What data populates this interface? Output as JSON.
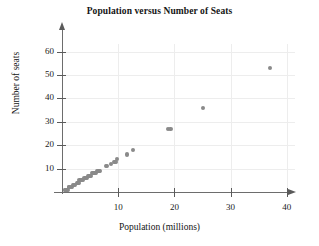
{
  "chart_data": {
    "type": "scatter",
    "title": "Population versus Number of Seats",
    "xlabel": "Population (millions)",
    "ylabel": "Number of seats",
    "xlim": [
      0,
      42
    ],
    "ylim": [
      0,
      65
    ],
    "xticks": [
      10,
      20,
      30,
      40
    ],
    "yticks": [
      10,
      20,
      30,
      40,
      50,
      60
    ],
    "grid": true,
    "legend": null,
    "marker_color": "#8a8a8a",
    "axis_color": "#5a5a5a",
    "grid_color": "#ededed",
    "series": [
      {
        "name": "States",
        "points": [
          [
            0.6,
            1
          ],
          [
            0.6,
            1
          ],
          [
            0.7,
            1
          ],
          [
            0.8,
            1
          ],
          [
            0.9,
            1
          ],
          [
            1.1,
            1
          ],
          [
            1.3,
            2
          ],
          [
            1.3,
            2
          ],
          [
            1.6,
            2
          ],
          [
            1.8,
            2
          ],
          [
            2.0,
            3
          ],
          [
            2.1,
            3
          ],
          [
            2.3,
            3
          ],
          [
            2.6,
            4
          ],
          [
            2.8,
            4
          ],
          [
            2.9,
            4
          ],
          [
            3.0,
            4
          ],
          [
            3.1,
            5
          ],
          [
            3.4,
            5
          ],
          [
            3.6,
            5
          ],
          [
            3.8,
            5
          ],
          [
            4.0,
            6
          ],
          [
            4.3,
            6
          ],
          [
            4.5,
            6
          ],
          [
            4.7,
            7
          ],
          [
            4.9,
            7
          ],
          [
            5.1,
            7
          ],
          [
            5.3,
            8
          ],
          [
            5.6,
            8
          ],
          [
            5.8,
            8
          ],
          [
            6.0,
            8
          ],
          [
            6.3,
            9
          ],
          [
            6.5,
            9
          ],
          [
            6.6,
            9
          ],
          [
            6.7,
            9
          ],
          [
            7.8,
            11
          ],
          [
            8.0,
            11
          ],
          [
            8.7,
            12
          ],
          [
            9.2,
            13
          ],
          [
            9.4,
            13
          ],
          [
            9.6,
            13
          ],
          [
            9.8,
            14
          ],
          [
            11.5,
            16
          ],
          [
            12.7,
            18
          ],
          [
            18.8,
            27
          ],
          [
            19.3,
            27
          ],
          [
            25.1,
            36
          ],
          [
            37.0,
            53
          ]
        ]
      }
    ]
  }
}
